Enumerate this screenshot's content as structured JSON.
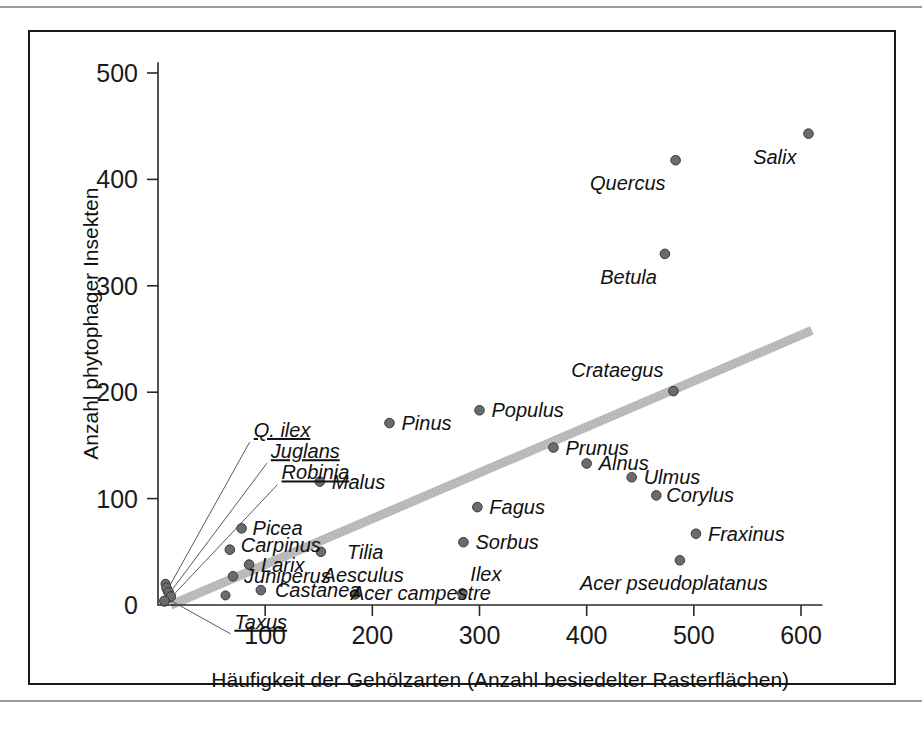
{
  "chart_data": {
    "type": "scatter",
    "title": "",
    "xlabel": "Häufigkeit der Gehölzarten (Anzahl besiedelter Rasterflächen)",
    "ylabel": "Anzahl phytophager Insekten",
    "xlim": [
      0,
      620
    ],
    "ylim": [
      0,
      510
    ],
    "xticks": [
      100,
      200,
      300,
      400,
      500,
      600
    ],
    "xtick_labels": [
      "100",
      "200",
      "300",
      "400",
      "500",
      "600"
    ],
    "yticks": [
      0,
      100,
      200,
      300,
      400,
      500
    ],
    "ytick_labels": [
      "0",
      "100",
      "200",
      "300",
      "400",
      "500"
    ],
    "grid": false,
    "legend": "none",
    "marker": "filled-circle-gray",
    "points": [
      {
        "label": "Salix",
        "x": 607,
        "y": 443,
        "label_dx": -12,
        "label_dy": 30,
        "anchor": "end",
        "leader": false,
        "underline": false
      },
      {
        "label": "Quercus",
        "x": 483,
        "y": 418,
        "label_dx": -10,
        "label_dy": 30,
        "anchor": "end",
        "leader": false,
        "underline": false
      },
      {
        "label": "Betula",
        "x": 473,
        "y": 330,
        "label_dx": -8,
        "label_dy": 30,
        "anchor": "end",
        "leader": false,
        "underline": false
      },
      {
        "label": "Crataegus",
        "x": 481,
        "y": 201,
        "label_dx": -10,
        "label_dy": -14,
        "anchor": "end",
        "leader": false,
        "underline": false
      },
      {
        "label": "Populus",
        "x": 300,
        "y": 183,
        "label_dx": 12,
        "label_dy": 7,
        "anchor": "start",
        "leader": false,
        "underline": false
      },
      {
        "label": "Pinus",
        "x": 216,
        "y": 171,
        "label_dx": 12,
        "label_dy": 7,
        "anchor": "start",
        "leader": false,
        "underline": false
      },
      {
        "label": "Prunus",
        "x": 369,
        "y": 148,
        "label_dx": 12,
        "label_dy": 7,
        "anchor": "start",
        "leader": false,
        "underline": false
      },
      {
        "label": "Alnus",
        "x": 400,
        "y": 133,
        "label_dx": 12,
        "label_dy": 7,
        "anchor": "start",
        "leader": false,
        "underline": false
      },
      {
        "label": "Ulmus",
        "x": 442,
        "y": 120,
        "label_dx": 12,
        "label_dy": 7,
        "anchor": "start",
        "leader": false,
        "underline": false
      },
      {
        "label": "Malus",
        "x": 151,
        "y": 116,
        "label_dx": 12,
        "label_dy": 7,
        "anchor": "start",
        "leader": false,
        "underline": false
      },
      {
        "label": "Corylus",
        "x": 465,
        "y": 103,
        "label_dx": 10,
        "label_dy": 7,
        "anchor": "start",
        "leader": false,
        "underline": false
      },
      {
        "label": "Fagus",
        "x": 298,
        "y": 92,
        "label_dx": 12,
        "label_dy": 7,
        "anchor": "start",
        "leader": false,
        "underline": false
      },
      {
        "label": "Picea",
        "x": 78,
        "y": 72,
        "label_dx": 11,
        "label_dy": 7,
        "anchor": "start",
        "leader": false,
        "underline": false
      },
      {
        "label": "Fraxinus",
        "x": 502,
        "y": 67,
        "label_dx": 12,
        "label_dy": 7,
        "anchor": "start",
        "leader": false,
        "underline": false
      },
      {
        "label": "Sorbus",
        "x": 285,
        "y": 59,
        "label_dx": 12,
        "label_dy": 7,
        "anchor": "start",
        "leader": false,
        "underline": false
      },
      {
        "label": "Carpinus",
        "x": 67,
        "y": 52,
        "label_dx": 11,
        "label_dy": 2,
        "anchor": "start",
        "leader": false,
        "underline": false
      },
      {
        "label": "Tilia",
        "x": 152,
        "y": 50,
        "label_dx": 26,
        "label_dy": 7,
        "anchor": "start",
        "leader": false,
        "underline": false
      },
      {
        "label": "Acer pseudoplatanus",
        "x": 487,
        "y": 42,
        "label_dx": -6,
        "label_dy": 30,
        "anchor": "middle",
        "leader": false,
        "underline": false
      },
      {
        "label": "Larix",
        "x": 85,
        "y": 38,
        "label_dx": 12,
        "label_dy": 7,
        "anchor": "start",
        "leader": false,
        "underline": false
      },
      {
        "label": "Juniperus",
        "x": 70,
        "y": 27,
        "label_dx": 11,
        "label_dy": 7,
        "anchor": "start",
        "leader": false,
        "underline": false
      },
      {
        "label": "Acer campestre",
        "x": 152,
        "y": 50,
        "label_dx": 30,
        "label_dy": 48,
        "anchor": "start",
        "leader": false,
        "underline": false,
        "label_only": true
      },
      {
        "label": "Castanea",
        "x": 96,
        "y": 14,
        "label_dx": 14,
        "label_dy": 7,
        "anchor": "start",
        "leader": false,
        "underline": false
      },
      {
        "label": "Aesculus",
        "x": 184,
        "y": 10,
        "label_dx": 8,
        "label_dy": -12,
        "anchor": "middle",
        "leader": false,
        "underline": false
      },
      {
        "label": "Ilex",
        "x": 284,
        "y": 11,
        "label_dx": 8,
        "label_dy": -12,
        "anchor": "start",
        "leader": false,
        "underline": false
      },
      {
        "label": "Q. ilex",
        "x": 8,
        "y": 16,
        "leader": true,
        "leader_to_x": 44,
        "leader_to_y": 151,
        "anchor": "start",
        "underline": true
      },
      {
        "label": "Juglans",
        "x": 10,
        "y": 12,
        "leader": true,
        "leader_to_x": 58,
        "leader_to_y": 134,
        "anchor": "start",
        "underline": true
      },
      {
        "label": "Robinia",
        "x": 12,
        "y": 8,
        "leader": true,
        "leader_to_x": 66,
        "leader_to_y": 117,
        "anchor": "start",
        "underline": true
      },
      {
        "label": "Taxus",
        "x": 6,
        "y": 4,
        "leader": true,
        "leader_to_x": 28,
        "leader_to_y": -28,
        "anchor": "start",
        "underline": true
      }
    ],
    "extra_points": [
      {
        "x": 7,
        "y": 20
      },
      {
        "x": 9,
        "y": 13
      },
      {
        "x": 11,
        "y": 7
      },
      {
        "x": 6,
        "y": 3
      },
      {
        "x": 63,
        "y": 9
      }
    ],
    "trendline": {
      "label": "regression",
      "x0": 12,
      "y0": 0,
      "x1": 610,
      "y1": 258,
      "color": "#c0c0c0"
    }
  },
  "colors": {
    "frame": "#1a1a1a",
    "axis": "#2a2a2a",
    "marker_fill": "#6b6b6b",
    "marker_stroke": "#3a3a3a",
    "trend": "#c0c0c0",
    "rule": "#9a9a9a",
    "background": "#ffffff"
  }
}
